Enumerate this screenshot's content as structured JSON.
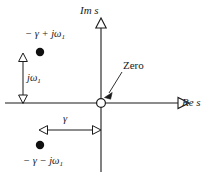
{
  "figure": {
    "kind": "s-plane-pole-zero-diagram",
    "background_color": "#ffffff",
    "ink_color": "#1a1a1a"
  },
  "axes": {
    "imaginary": {
      "label": "Im s",
      "name": "imaginary-axis",
      "arrow_direction": "up"
    },
    "real": {
      "label": "Re s",
      "name": "real-axis",
      "arrow_direction": "right"
    },
    "origin": {
      "x": 101,
      "y": 103
    }
  },
  "markers": {
    "zero": {
      "label": "Zero",
      "marker_style": "open-circle",
      "x": 101,
      "y": 103
    },
    "poles": [
      {
        "label": "− γ + jω",
        "subscript": "1",
        "marker_style": "filled-circle",
        "x": 40,
        "y": 52
      },
      {
        "label": "− γ − jω",
        "subscript": "1",
        "marker_style": "filled-circle",
        "x": 40,
        "y": 145
      }
    ]
  },
  "dimensions": [
    {
      "name": "imaginary-offset",
      "label": "jω",
      "subscript": "1",
      "orientation": "vertical",
      "arrowheads": "double",
      "from": {
        "x": 23,
        "y": 56
      },
      "to": {
        "x": 23,
        "y": 103
      }
    },
    {
      "name": "real-offset",
      "label": "γ",
      "subscript": "",
      "orientation": "horizontal",
      "arrowheads": "double",
      "from": {
        "x": 42,
        "y": 130
      },
      "to": {
        "x": 100,
        "y": 130
      }
    }
  ],
  "callout": {
    "label": "Zero",
    "leader_from": {
      "x": 122,
      "y": 73
    },
    "leader_to": {
      "x": 107,
      "y": 95
    }
  }
}
